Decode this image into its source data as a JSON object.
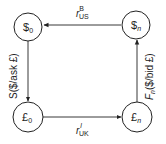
{
  "diagram": {
    "nodes": [
      {
        "id": "usd-0",
        "symbol": "$",
        "subscript": "0"
      },
      {
        "id": "usd-n",
        "symbol": "$",
        "subscript": "n"
      },
      {
        "id": "gbp-0",
        "symbol": "£",
        "subscript": "0"
      },
      {
        "id": "gbp-n",
        "symbol": "£",
        "subscript": "n"
      }
    ],
    "edges": {
      "top": {
        "from": "usd-n",
        "to": "usd-0",
        "base": "r",
        "sub": "US",
        "sup": "B"
      },
      "bottom": {
        "from": "gbp-0",
        "to": "gbp-n",
        "base": "r",
        "sub": "UK",
        "sup": "l"
      },
      "left": {
        "from": "usd-0",
        "to": "gbp-0",
        "label": "S($/ask £)"
      },
      "right": {
        "from": "gbp-n",
        "to": "usd-n",
        "base": "F",
        "sub": "n",
        "rest": "($/bid £)"
      }
    }
  },
  "colors": {
    "stroke": "#222222",
    "background": "#ffffff"
  }
}
